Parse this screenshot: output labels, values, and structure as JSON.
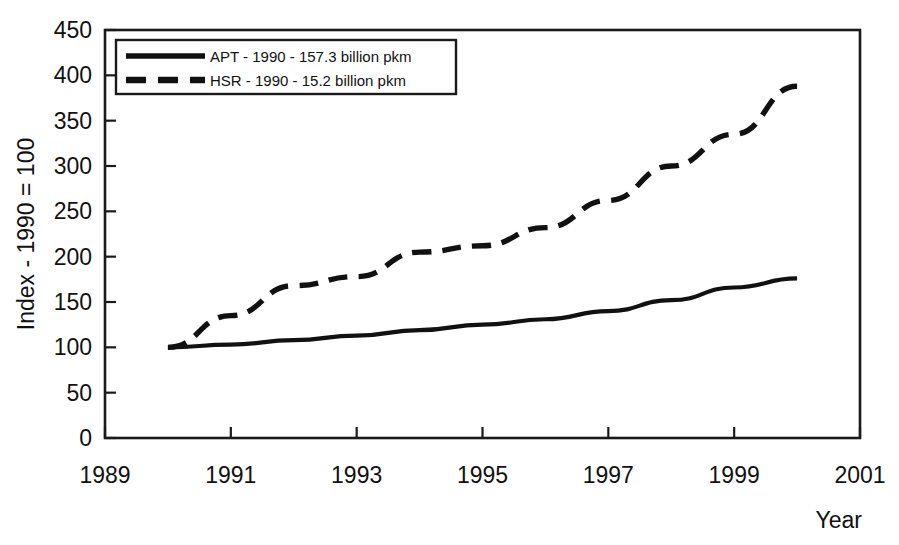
{
  "chart_data": {
    "type": "line",
    "title": "",
    "xlabel": "Year",
    "ylabel": "Index - 1990 = 100",
    "xlim": [
      1989,
      2001
    ],
    "ylim": [
      0,
      450
    ],
    "xticks": [
      "1989",
      "1991",
      "1993",
      "1995",
      "1997",
      "1999",
      "2001"
    ],
    "xtick_values": [
      1989,
      1991,
      1993,
      1995,
      1997,
      1999,
      2001
    ],
    "yticks": [
      "0",
      "50",
      "100",
      "150",
      "200",
      "250",
      "300",
      "350",
      "400",
      "450"
    ],
    "ytick_values": [
      0,
      50,
      100,
      150,
      200,
      250,
      300,
      350,
      400,
      450
    ],
    "grid": false,
    "legend_position": "top-left-inside",
    "x": [
      1990,
      1991,
      1992,
      1993,
      1994,
      1995,
      1996,
      1997,
      1998,
      1999,
      2000
    ],
    "series": [
      {
        "name": "APT - 1990 - 157.3 billion pkm",
        "style": "solid",
        "color": "#111111",
        "values": [
          100,
          103,
          108,
          113,
          119,
          125,
          131,
          140,
          152,
          166,
          176
        ]
      },
      {
        "name": "HSR - 1990 - 15.2 billion pkm",
        "style": "dashed",
        "color": "#111111",
        "values": [
          100,
          135,
          168,
          178,
          205,
          212,
          232,
          262,
          300,
          335,
          388
        ]
      }
    ]
  },
  "axes": {
    "y_axis_title": "Index - 1990 = 100",
    "x_axis_title": "Year"
  },
  "legend": {
    "entries": [
      {
        "label": "APT - 1990 - 157.3 billion pkm",
        "style": "solid"
      },
      {
        "label": "HSR - 1990 - 15.2 billion pkm",
        "style": "dashed"
      }
    ]
  }
}
